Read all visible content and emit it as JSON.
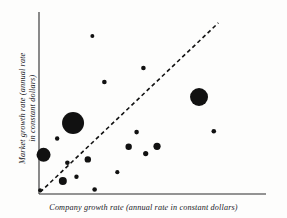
{
  "figure": {
    "background_color": "#fdfdfc",
    "ink_color": "#111111",
    "axis_color": "#2b2b2b"
  },
  "labels": {
    "x_axis": "Company growth rate (annual rate in constant dollars)",
    "y_axis_line1": "Market growth rate (annual rate",
    "y_axis_line2": "in constant dollars)"
  },
  "chart_data": {
    "type": "scatter",
    "title": "",
    "xlabel": "Company growth rate (annual rate in constant dollars)",
    "ylabel": "Market growth rate (annual rate in constant dollars)",
    "grid": false,
    "legend": null,
    "axis_ticks": [],
    "xlim": [
      0,
      100
    ],
    "ylim": [
      0,
      100
    ],
    "marker_color": "#111111",
    "reference_line": {
      "style": "dashed",
      "slope": 1,
      "intercept": 0,
      "x_start": 0.5,
      "y_start": 1,
      "x_end": 79,
      "y_end": 94,
      "dash_pattern": "4 3",
      "width": 1.6
    },
    "points": [
      {
        "x": 23.5,
        "y": 86.8,
        "r": 2.0
      },
      {
        "x": 46.0,
        "y": 69.2,
        "r": 2.3
      },
      {
        "x": 28.8,
        "y": 61.5,
        "r": 2.3
      },
      {
        "x": 70.5,
        "y": 53.3,
        "r": 9.0
      },
      {
        "x": 15.0,
        "y": 39.0,
        "r": 11.0
      },
      {
        "x": 43.0,
        "y": 34.0,
        "r": 2.3
      },
      {
        "x": 77.0,
        "y": 34.5,
        "r": 2.3
      },
      {
        "x": 8.0,
        "y": 30.5,
        "r": 2.2
      },
      {
        "x": 39.5,
        "y": 26.0,
        "r": 3.2
      },
      {
        "x": 52.0,
        "y": 26.2,
        "r": 3.6
      },
      {
        "x": 47.0,
        "y": 22.2,
        "r": 2.6
      },
      {
        "x": 2.0,
        "y": 21.5,
        "r": 7.0
      },
      {
        "x": 21.5,
        "y": 19.0,
        "r": 3.2
      },
      {
        "x": 12.5,
        "y": 17.2,
        "r": 2.3
      },
      {
        "x": 34.5,
        "y": 12.0,
        "r": 2.1
      },
      {
        "x": 16.5,
        "y": 9.5,
        "r": 2.2
      },
      {
        "x": 10.5,
        "y": 7.2,
        "r": 4.0
      },
      {
        "x": 24.5,
        "y": 2.5,
        "r": 2.3
      },
      {
        "x": 0.5,
        "y": 2.0,
        "r": 2.0
      }
    ]
  }
}
